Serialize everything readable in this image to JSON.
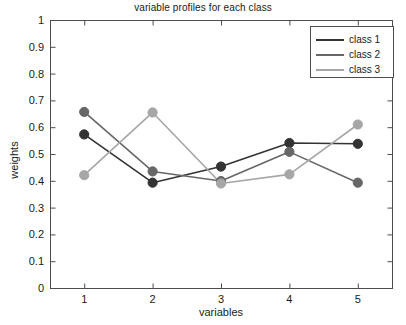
{
  "chart_data": {
    "type": "line",
    "title": "variable profiles for each class",
    "xlabel": "variables",
    "ylabel": "weights",
    "x": [
      1,
      2,
      3,
      4,
      5
    ],
    "xtick_labels": [
      "1",
      "2",
      "3",
      "4",
      "5"
    ],
    "ytick_labels": [
      "0",
      "0.1",
      "0.2",
      "0.3",
      "0.4",
      "0.5",
      "0.6",
      "0.7",
      "0.8",
      "0.9",
      "1"
    ],
    "xlim": [
      0.5,
      5.5
    ],
    "ylim": [
      0,
      1
    ],
    "grid": false,
    "legend_position": "top-right",
    "markers": "filled-circle",
    "series": [
      {
        "name": "class 1",
        "color": "#333333",
        "values": [
          0.573,
          0.393,
          0.453,
          0.541,
          0.538
        ]
      },
      {
        "name": "class 2",
        "color": "#676767",
        "values": [
          0.657,
          0.435,
          0.399,
          0.508,
          0.393
        ]
      },
      {
        "name": "class 3",
        "color": "#a6a6a6",
        "values": [
          0.421,
          0.655,
          0.39,
          0.424,
          0.61
        ]
      }
    ]
  },
  "axes": {
    "box_color": "#4d4d4d",
    "background": "#ffffff"
  }
}
